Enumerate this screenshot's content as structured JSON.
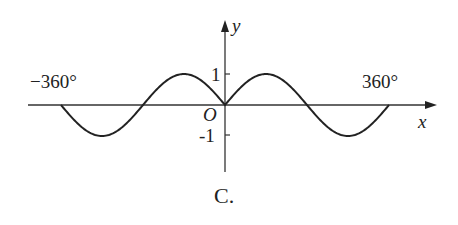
{
  "figure": {
    "caption": "C.",
    "x_axis_label": "x",
    "y_axis_label": "y",
    "origin_label": "O",
    "tick_y_pos": "1",
    "tick_y_neg": "-1",
    "tick_x_neg": "−360°",
    "tick_x_pos": "360°",
    "function": "y = sin|x|"
  },
  "chart_data": {
    "type": "line",
    "title": "",
    "xlabel": "x",
    "ylabel": "y",
    "x": [
      -360,
      -270,
      -180,
      -90,
      0,
      90,
      180,
      270,
      360
    ],
    "series": [
      {
        "name": "y = sin|x|",
        "values": [
          0,
          -1,
          0,
          1,
          0,
          1,
          0,
          -1,
          0
        ]
      }
    ],
    "xlim": [
      -360,
      360
    ],
    "ylim": [
      -1,
      1
    ],
    "grid": false
  }
}
